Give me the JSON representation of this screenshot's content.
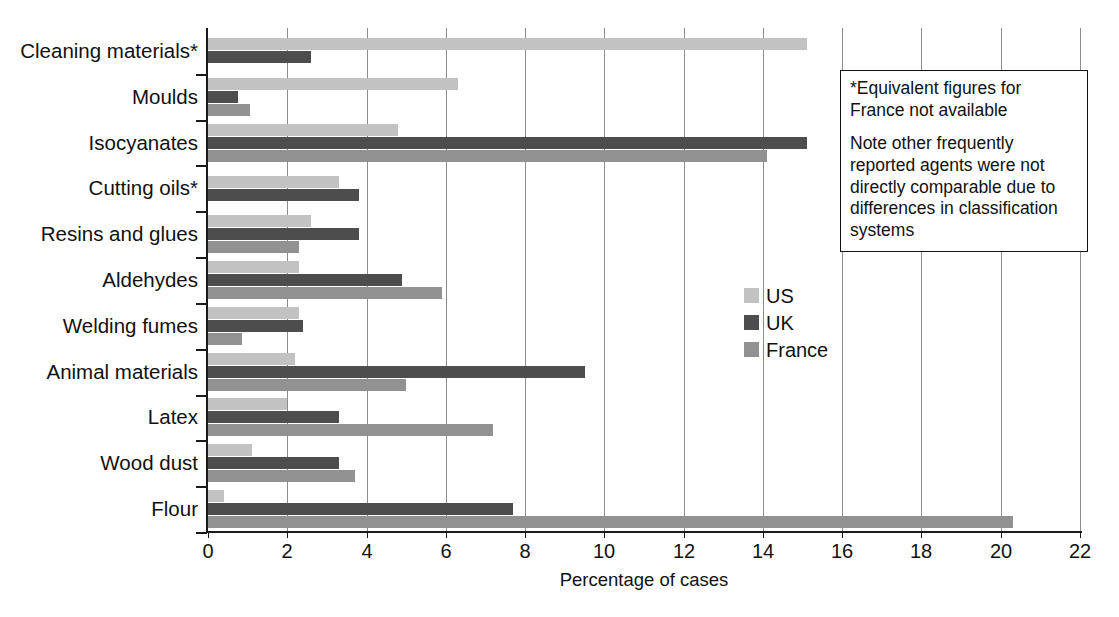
{
  "chart_data": {
    "type": "bar",
    "orientation": "horizontal",
    "title": "",
    "xlabel": "Percentage of cases",
    "ylabel": "",
    "xlim": [
      0,
      22
    ],
    "xticks": [
      0,
      2,
      4,
      6,
      8,
      10,
      12,
      14,
      16,
      18,
      20,
      22
    ],
    "grid": "vertical",
    "legend_position": "center-right",
    "categories": [
      "Cleaning materials*",
      "Moulds",
      "Isocyanates",
      "Cutting oils*",
      "Resins and glues",
      "Aldehydes",
      "Welding fumes",
      "Animal materials",
      "Latex",
      "Wood dust",
      "Flour"
    ],
    "series": [
      {
        "name": "US",
        "color": "#c2c2c2",
        "values": [
          15.1,
          6.3,
          4.8,
          3.3,
          2.6,
          2.3,
          2.3,
          2.2,
          2.0,
          1.1,
          0.4
        ]
      },
      {
        "name": "UK",
        "color": "#4d4d4d",
        "values": [
          2.6,
          0.75,
          15.1,
          3.8,
          3.8,
          4.9,
          2.4,
          9.5,
          3.3,
          3.3,
          7.7
        ]
      },
      {
        "name": "France",
        "color": "#919191",
        "values": [
          null,
          1.05,
          14.1,
          null,
          2.3,
          5.9,
          0.85,
          5.0,
          7.2,
          3.7,
          20.3
        ]
      }
    ]
  },
  "legend": {
    "items": [
      {
        "label": "US",
        "color": "#c2c2c2"
      },
      {
        "label": "UK",
        "color": "#4d4d4d"
      },
      {
        "label": "France",
        "color": "#919191"
      }
    ]
  },
  "note_box": {
    "paragraph_1": "*Equivalent figures for France not available",
    "paragraph_2": "Note other frequently reported agents were not directly comparable due to differences in classification systems"
  }
}
